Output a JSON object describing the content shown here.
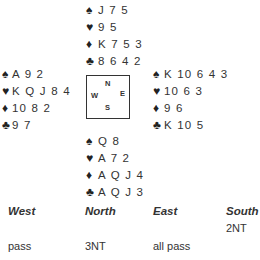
{
  "deal": {
    "north": {
      "spades": "J 7 5",
      "hearts": "9 5",
      "diamonds": "K 7 5 3",
      "clubs": "8 6 4 2"
    },
    "west": {
      "spades": "A 9 2",
      "hearts": "K Q J 8 4",
      "diamonds": "10 8 2",
      "clubs": "9 7"
    },
    "east": {
      "spades": "K 10 6 4 3",
      "hearts": "10 6 3",
      "diamonds": "9 6",
      "clubs": "K 10 5"
    },
    "south": {
      "spades": "Q 8",
      "hearts": "A 7 2",
      "diamonds": "A Q J 4",
      "clubs": "A Q J 3"
    }
  },
  "suits": {
    "spades": "♠",
    "hearts": "♥",
    "diamonds": "♦",
    "clubs": "♣"
  },
  "compass": {
    "n": "N",
    "w": "W",
    "e": "E",
    "s": "S"
  },
  "bidding": {
    "headers": {
      "west": "West",
      "north": "North",
      "east": "East",
      "south": "South"
    },
    "rounds": [
      {
        "west": "",
        "north": "",
        "east": "",
        "south": "2NT"
      },
      {
        "west": "pass",
        "north": "3NT",
        "east": "all pass",
        "south": ""
      }
    ]
  }
}
